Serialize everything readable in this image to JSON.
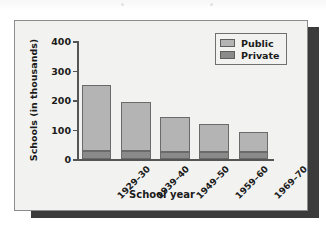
{
  "chart_data": {
    "type": "bar",
    "subtype": "stacked-vertical",
    "title": "",
    "xlabel": "School year",
    "ylabel": "Schools (in thousands)",
    "categories": [
      "1929–30",
      "1939–40",
      "1949–50",
      "1959–60",
      "1969–70"
    ],
    "series": [
      {
        "name": "Private",
        "color": "#8a8a8a",
        "values": [
          26,
          26,
          25,
          25,
          25
        ]
      },
      {
        "name": "Public",
        "color": "#b4b4b4",
        "values": [
          224,
          166,
          117,
          95,
          65
        ]
      }
    ],
    "totals": [
      250,
      192,
      142,
      120,
      90
    ],
    "ylim": [
      0,
      400
    ],
    "yticks": [
      0,
      100,
      200,
      300,
      400
    ],
    "ytick_labels": [
      "0",
      "100",
      "200",
      "300",
      "400"
    ],
    "grid": false,
    "legend_position": "top-right",
    "legend_entries": [
      {
        "label": "Public",
        "color": "#b4b4b4"
      },
      {
        "label": "Private",
        "color": "#8a8a8a"
      }
    ]
  },
  "figure": {
    "panel_background": "#f2f2f0",
    "panel_border_color": "#8c8c8c",
    "shadow_color": "#3b3b3b",
    "axis_color": "#555555",
    "text_color": "#1b1b1b"
  }
}
